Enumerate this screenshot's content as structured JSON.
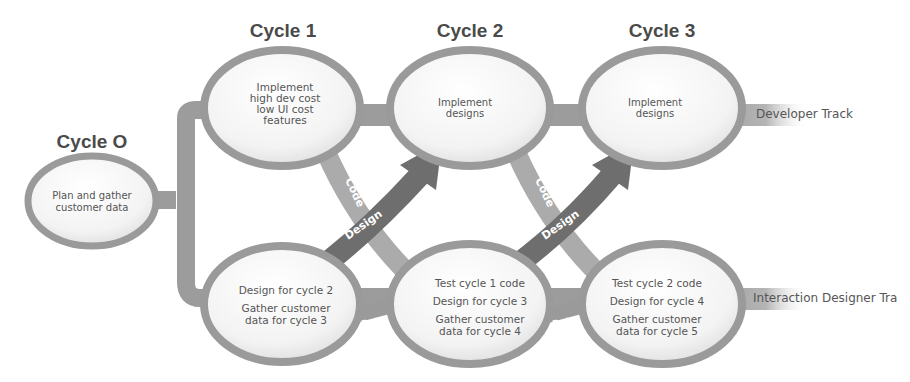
{
  "diagram": {
    "cycles": [
      {
        "id": "c0",
        "title": "Cycle O",
        "lines": [
          "Plan and gather",
          "customer data"
        ]
      },
      {
        "id": "c1",
        "title": "Cycle 1",
        "lines": [
          "Implement",
          "high dev cost",
          "low UI cost",
          "features"
        ]
      },
      {
        "id": "c2",
        "title": "Cycle 2",
        "lines": [
          "Implement",
          "designs"
        ]
      },
      {
        "id": "c3",
        "title": "Cycle 3",
        "lines": [
          "Implement",
          "designs"
        ]
      }
    ],
    "designer_nodes": [
      {
        "id": "d1",
        "groups": [
          [
            "Design for cycle 2"
          ],
          [
            "Gather customer",
            "data for cycle 3"
          ]
        ]
      },
      {
        "id": "d2",
        "groups": [
          [
            "Test cycle 1 code"
          ],
          [
            "Design for cycle 3"
          ],
          [
            "Gather customer",
            "data for cycle 4"
          ]
        ]
      },
      {
        "id": "d3",
        "groups": [
          [
            "Test cycle 2 code"
          ],
          [
            "Design for cycle 4"
          ],
          [
            "Gather customer",
            "data for cycle 5"
          ]
        ]
      }
    ],
    "tracks": {
      "developer": "Developer Track",
      "designer": "Interaction Designer Tra"
    },
    "arrow_labels": {
      "code": "Code",
      "design": "Design",
      "data": "Data"
    },
    "colors": {
      "track": "#9a9a9a",
      "ring": "#8f8f8f",
      "node_fill": "#f4f4f4",
      "code_arrow": "#a8a8a8",
      "design_arrow": "#6a6a6a",
      "title_text": "#4a4a4a",
      "body_text": "#555555"
    }
  }
}
